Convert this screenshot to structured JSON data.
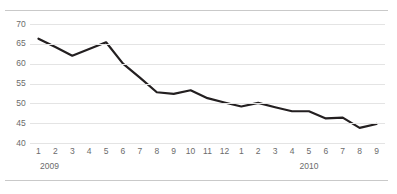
{
  "chart_data": {
    "type": "line",
    "title": "",
    "subtitle": "",
    "xlabel": "",
    "ylabel": "",
    "ylim": [
      40,
      70
    ],
    "yticks": [
      40,
      45,
      50,
      55,
      60,
      65,
      70
    ],
    "ytick_labels": [
      "40",
      "45",
      "50",
      "55",
      "60",
      "65",
      "70"
    ],
    "grid": true,
    "legend": "none",
    "line_color": "#231f20",
    "grid_color": "#e4e4e4",
    "rule_color": "#c9c9c9",
    "tick_text_color": "#6b6b6b",
    "categories": [
      "1",
      "2",
      "3",
      "4",
      "5",
      "6",
      "7",
      "8",
      "9",
      "10",
      "11",
      "12",
      "1",
      "2",
      "3",
      "4",
      "5",
      "6",
      "7",
      "8",
      "9"
    ],
    "groups": [
      {
        "label": "2009",
        "start_index": 0,
        "end_index": 11
      },
      {
        "label": "2010",
        "start_index": 12,
        "end_index": 20
      }
    ],
    "series": [
      {
        "name": "value",
        "values": [
          66.3,
          64.2,
          62.0,
          63.7,
          65.4,
          60.0,
          56.5,
          52.8,
          52.4,
          53.3,
          51.3,
          50.2,
          49.2,
          50.1,
          49.0,
          48.0,
          48.0,
          46.2,
          46.4,
          43.8,
          44.8
        ]
      }
    ]
  }
}
